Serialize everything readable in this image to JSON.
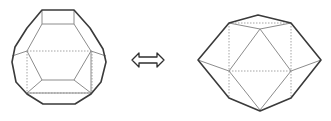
{
  "diagram": {
    "left_figure": {
      "name": "truncated-octahedron",
      "label": ""
    },
    "connector": {
      "symbol": "⇔",
      "meaning": "double-arrow"
    },
    "right_figure": {
      "name": "cuboctahedron-like-polyhedron",
      "label": ""
    },
    "colors": {
      "outline": "#3a3a3a",
      "visible_edge": "#8c8c8c",
      "hidden_edge": "#9a9a9a",
      "background": "#ffffff"
    }
  }
}
